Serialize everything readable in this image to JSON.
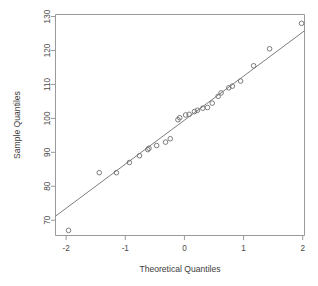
{
  "figure": {
    "kind": "normal-qq-plot",
    "background_color": "#ffffff",
    "frame_color": "#9a9a9a",
    "point_color": "#6e6e6e",
    "line_color": "#6e6e6e",
    "width": 318,
    "height": 286
  },
  "chart_data": {
    "type": "scatter",
    "title": "",
    "xlabel": "Theoretical Quantiles",
    "ylabel": "Sample Quantiles",
    "xlim": [
      -2.18,
      2.03
    ],
    "ylim": [
      65.5,
      130.6
    ],
    "xticks": [
      -2,
      -1,
      0,
      1,
      2
    ],
    "xticklabels": [
      "-2",
      "-1",
      "0",
      "1",
      "2"
    ],
    "yticks": [
      70,
      80,
      90,
      100,
      110,
      120,
      130
    ],
    "yticklabels": [
      "70",
      "80",
      "90",
      "100",
      "110",
      "120",
      "130"
    ],
    "grid": false,
    "legend": null,
    "marker": "open-circle",
    "series": [
      {
        "name": "sample quantiles",
        "x": [
          -1.96,
          -1.44,
          -1.15,
          -0.93,
          -0.76,
          -0.62,
          -0.6,
          -0.47,
          -0.32,
          -0.24,
          -0.11,
          -0.08,
          0.02,
          0.08,
          0.17,
          0.22,
          0.31,
          0.39,
          0.47,
          0.57,
          0.62,
          0.75,
          0.81,
          0.95,
          1.17,
          1.44,
          1.98
        ],
        "y": [
          67.0,
          84.0,
          84.0,
          87.0,
          89.0,
          90.8,
          91.2,
          92.0,
          93.0,
          94.0,
          99.6,
          100.2,
          101.0,
          101.2,
          102.0,
          102.4,
          103.0,
          103.2,
          104.5,
          106.5,
          107.5,
          109.0,
          109.5,
          111.0,
          115.5,
          120.5,
          128.0
        ]
      }
    ],
    "reference_line": {
      "name": "qqline",
      "x": [
        -2.18,
        2.03
      ],
      "y": [
        71.2,
        125.8
      ]
    }
  },
  "axis": {
    "x_title": "Theoretical Quantiles",
    "y_title": "Sample Quantiles"
  }
}
